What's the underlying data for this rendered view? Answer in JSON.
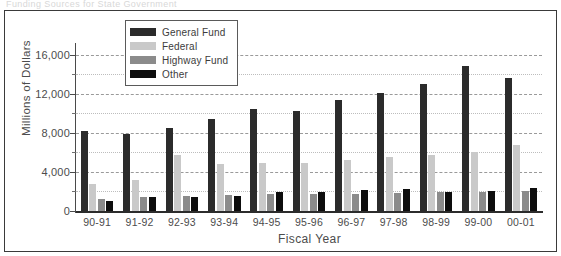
{
  "top_cut_text": "Funding Sources for State Government",
  "chart_data": {
    "type": "bar",
    "title": "",
    "xlabel": "Fiscal Year",
    "ylabel": "Millions of Dollars",
    "ylim": [
      0,
      17000
    ],
    "yticks": [
      0,
      4000,
      8000,
      12000,
      16000
    ],
    "ytick_labels": [
      "0",
      "4,000",
      "8,000",
      "12,000",
      "16,000"
    ],
    "minor_yticks": [
      2000,
      6000,
      10000,
      14000
    ],
    "grid": true,
    "legend_position": "top-center",
    "categories": [
      "90-91",
      "91-92",
      "92-93",
      "93-94",
      "94-95",
      "95-96",
      "96-97",
      "97-98",
      "98-99",
      "99-00",
      "00-01"
    ],
    "series": [
      {
        "name": "General Fund",
        "color": "#2b2b2b",
        "values": [
          8200,
          7900,
          8500,
          9400,
          10400,
          10200,
          11400,
          12100,
          13000,
          14900,
          13600
        ]
      },
      {
        "name": "Federal",
        "color": "#c9c9c9",
        "values": [
          2800,
          3200,
          5700,
          4800,
          4900,
          4950,
          5200,
          5500,
          5700,
          6000,
          6800
        ]
      },
      {
        "name": "Highway Fund",
        "color": "#8b8b8b",
        "values": [
          1250,
          1450,
          1500,
          1600,
          1700,
          1700,
          1750,
          1850,
          1900,
          1950,
          2050
        ]
      },
      {
        "name": "Other",
        "color": "#0d0d0d",
        "values": [
          1050,
          1400,
          1450,
          1500,
          1900,
          1900,
          2200,
          2300,
          1950,
          2000,
          2400
        ]
      }
    ]
  },
  "legend": {
    "items": [
      {
        "label": "General Fund",
        "color": "#2b2b2b"
      },
      {
        "label": "Federal",
        "color": "#c9c9c9"
      },
      {
        "label": "Highway Fund",
        "color": "#8b8b8b"
      },
      {
        "label": "Other",
        "color": "#0d0d0d"
      }
    ]
  }
}
